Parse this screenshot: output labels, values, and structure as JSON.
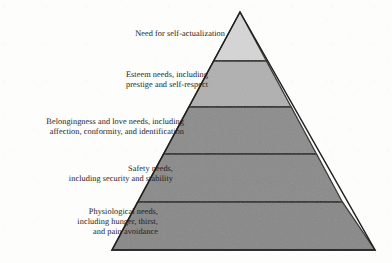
{
  "figure": {
    "kind": "maslow-hierarchy-of-needs-pyramid",
    "background_color": "#fdfdfc",
    "outline_color": "#262626"
  },
  "pyramid": {
    "apex": {
      "x": 240,
      "y": 12
    },
    "base_left": {
      "x": 112,
      "y": 250
    },
    "base_right": {
      "x": 375,
      "y": 250
    },
    "divider_y": [
      61,
      107,
      154,
      202
    ],
    "tiers": [
      {
        "level": 5,
        "name": "self-actualization",
        "fill": "#d5d5d5",
        "label": "Need for self-actualization"
      },
      {
        "level": 4,
        "name": "esteem",
        "fill": "#b0b0b0",
        "label": "Esteem needs, including\nprestige and self-respect"
      },
      {
        "level": 3,
        "name": "belongingness",
        "fill": "#8c8c8c",
        "label": "Belongingness and love needs, including\naffection, conformity, and identification"
      },
      {
        "level": 2,
        "name": "safety",
        "fill": "#8a8a8a",
        "label": "Safety needs,\nincluding security and stability"
      },
      {
        "level": 1,
        "name": "physiological",
        "fill": "#888888",
        "label": "Physiological needs,\nincluding hunger, thirst,\nand pain avoidance"
      }
    ]
  }
}
